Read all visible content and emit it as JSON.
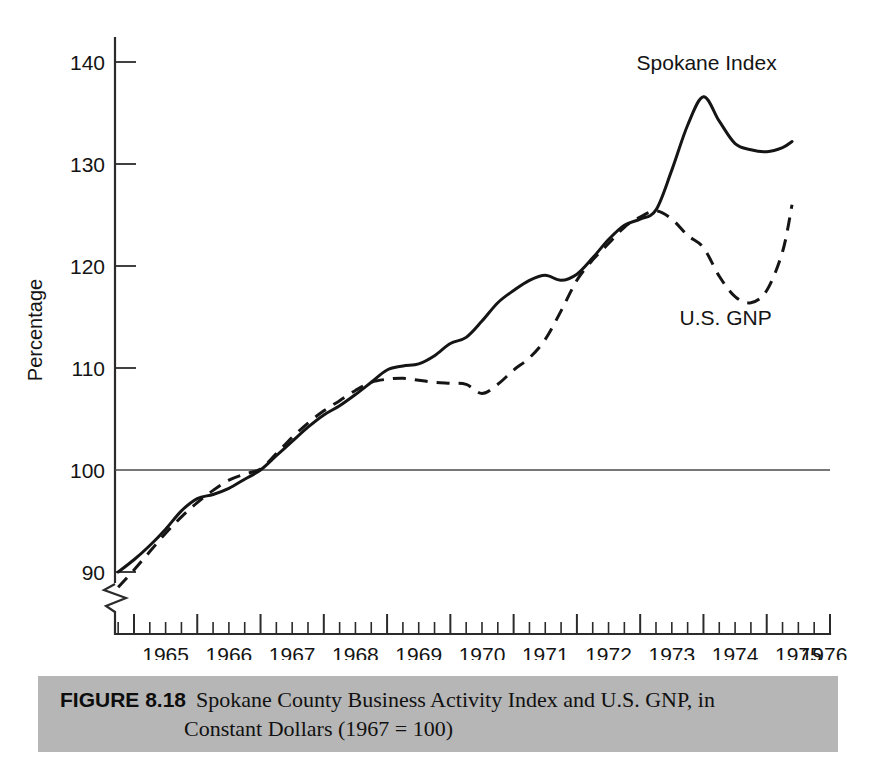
{
  "figure": {
    "caption_number": "FIGURE 8.18",
    "caption_line1": "Spokane County Business Activity Index and U.S. GNP, in",
    "caption_line2": "Constant Dollars (1967 = 100)",
    "caption_bg_color": "#b6b6b6"
  },
  "chart_data": {
    "type": "line",
    "title": "Spokane County Business Activity Index and U.S. GNP, in Constant Dollars (1967 = 100)",
    "xlabel": "",
    "ylabel": "Percentage",
    "xlim": [
      1964.7,
      1976.0
    ],
    "ylim": [
      86.5,
      143.0
    ],
    "y_ticks": [
      90,
      100,
      110,
      120,
      130,
      140
    ],
    "x_ticks": [
      1965,
      1966,
      1967,
      1968,
      1969,
      1970,
      1971,
      1972,
      1973,
      1974,
      1975,
      1976
    ],
    "x_minor_ticks_per_year": 4,
    "grid": false,
    "reference_line": {
      "y": 100,
      "label": "100"
    },
    "y_axis_break": true,
    "legend_position": "inline-annotation",
    "series": [
      {
        "name": "Spokane Index",
        "style": "solid",
        "label_x": 1974.05,
        "label_y": 139.2,
        "x": [
          1964.75,
          1965.0,
          1965.25,
          1965.5,
          1965.75,
          1966.0,
          1966.25,
          1966.5,
          1966.75,
          1967.0,
          1967.25,
          1967.5,
          1967.75,
          1968.0,
          1968.25,
          1968.5,
          1968.75,
          1969.0,
          1969.25,
          1969.5,
          1969.75,
          1970.0,
          1970.25,
          1970.5,
          1970.75,
          1971.0,
          1971.25,
          1971.5,
          1971.75,
          1972.0,
          1972.25,
          1972.5,
          1972.75,
          1973.0,
          1973.25,
          1973.5,
          1973.75,
          1974.0,
          1974.25,
          1974.5,
          1974.75,
          1975.0,
          1975.25,
          1975.4
        ],
        "y": [
          90.0,
          91.2,
          92.6,
          94.2,
          96.0,
          97.2,
          97.6,
          98.2,
          99.1,
          100.0,
          101.4,
          102.8,
          104.2,
          105.4,
          106.3,
          107.4,
          108.6,
          109.8,
          110.2,
          110.4,
          111.2,
          112.4,
          113.0,
          114.6,
          116.4,
          117.6,
          118.6,
          119.1,
          118.6,
          119.2,
          120.8,
          122.6,
          124.0,
          124.6,
          125.5,
          129.4,
          133.8,
          136.6,
          134.2,
          132.0,
          131.4,
          131.2,
          131.6,
          132.2
        ]
      },
      {
        "name": "U.S. GNP",
        "style": "dashed",
        "label_x": 1974.35,
        "label_y": 114.2,
        "x": [
          1964.75,
          1965.0,
          1965.25,
          1965.5,
          1965.75,
          1966.0,
          1966.25,
          1966.5,
          1966.75,
          1967.0,
          1967.25,
          1967.5,
          1967.75,
          1968.0,
          1968.25,
          1968.5,
          1968.75,
          1969.0,
          1969.25,
          1969.5,
          1969.75,
          1970.0,
          1970.25,
          1970.5,
          1970.75,
          1971.0,
          1971.25,
          1971.5,
          1971.75,
          1972.0,
          1972.25,
          1972.5,
          1972.75,
          1973.0,
          1973.25,
          1973.5,
          1973.75,
          1974.0,
          1974.25,
          1974.5,
          1974.75,
          1975.0,
          1975.25,
          1975.4
        ],
        "y": [
          88.5,
          90.2,
          92.0,
          93.8,
          95.4,
          96.8,
          98.0,
          99.0,
          99.6,
          100.1,
          101.6,
          103.2,
          104.6,
          105.8,
          106.8,
          107.8,
          108.6,
          108.9,
          109.0,
          108.8,
          108.6,
          108.5,
          108.4,
          107.5,
          108.4,
          109.8,
          111.0,
          112.8,
          115.6,
          118.6,
          120.6,
          122.2,
          123.8,
          124.8,
          125.4,
          124.6,
          123.0,
          121.8,
          119.0,
          117.0,
          116.4,
          117.6,
          121.4,
          126.0
        ]
      }
    ],
    "annotations": [
      {
        "text": "Spokane Index",
        "x": 1974.05,
        "y": 139.2
      },
      {
        "text": "U.S. GNP",
        "x": 1974.35,
        "y": 114.2
      }
    ]
  },
  "axis": {
    "y_title": "Percentage",
    "y_tick_labels": [
      "140",
      "130",
      "120",
      "110",
      "100",
      "90"
    ],
    "x_tick_labels": [
      "1965",
      "1966",
      "1967",
      "1968",
      "1969",
      "1970",
      "1971",
      "1972",
      "1973",
      "1974",
      "1975",
      "1976"
    ]
  }
}
